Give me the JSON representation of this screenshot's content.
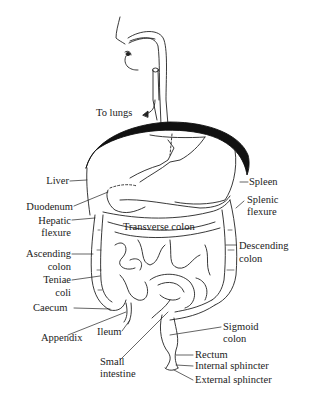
{
  "diagram": {
    "labels": {
      "to_lungs": "To lungs",
      "liver": "Liver",
      "duodenum": "Duodenum",
      "hepatic_flexure_1": "Hepatic",
      "hepatic_flexure_2": "flexure",
      "ascending_colon_1": "Ascending",
      "ascending_colon_2": "colon",
      "teniae_coli_1": "Teniae",
      "teniae_coli_2": "coli",
      "caecum": "Caecum",
      "appendix": "Appendix",
      "ileum": "Ileum",
      "small_intestine_1": "Small",
      "small_intestine_2": "intestine",
      "transverse_colon": "Transverse colon",
      "spleen": "Spleen",
      "splenic_flexure_1": "Splenic",
      "splenic_flexure_2": "flexure",
      "descending_colon_1": "Descending",
      "descending_colon_2": "colon",
      "sigmoid_colon_1": "Sigmoid",
      "sigmoid_colon_2": "colon",
      "rectum": "Rectum",
      "internal_sphincter": "Internal sphincter",
      "external_sphincter": "External sphincter"
    }
  }
}
